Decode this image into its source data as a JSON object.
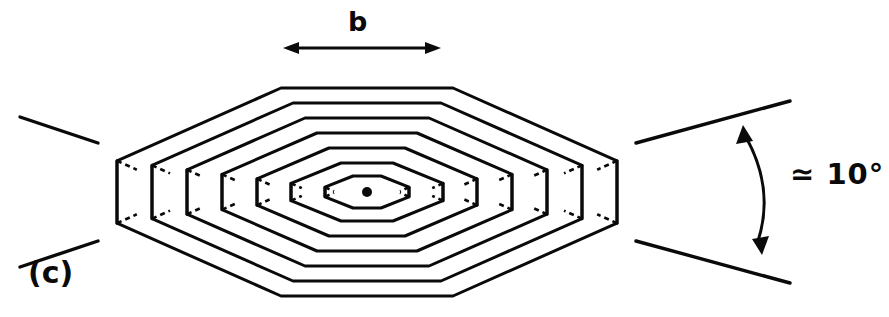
{
  "figure": {
    "panel_label": "(c)",
    "burgers_vector_label": "b",
    "angle_label": "≃ 10°",
    "stroke_color": "#0a0a0a",
    "background_color": "#ffffff",
    "center_dot": {
      "cx": 367,
      "cy": 192,
      "r": 5
    },
    "dimension_arrow": {
      "x1": 283,
      "y1": 48,
      "x2": 441,
      "y2": 48
    },
    "angle_arc": {
      "x1": 743,
      "y1": 125,
      "x2": 762,
      "y2": 255,
      "bulge": 22
    },
    "rings": [
      {
        "index": 1,
        "half_width": 42,
        "half_height": 16,
        "flat_half": 14,
        "depth": 10
      },
      {
        "index": 2,
        "half_width": 76,
        "half_height": 29,
        "flat_half": 26,
        "depth": 12
      },
      {
        "index": 3,
        "half_width": 110,
        "half_height": 44,
        "flat_half": 38,
        "depth": 14
      },
      {
        "index": 4,
        "half_width": 145,
        "half_height": 59,
        "flat_half": 50,
        "depth": 16
      },
      {
        "index": 5,
        "half_width": 180,
        "half_height": 74,
        "flat_half": 62,
        "depth": 18
      },
      {
        "index": 6,
        "half_width": 215,
        "half_height": 89,
        "flat_half": 74,
        "depth": 20
      },
      {
        "index": 7,
        "half_width": 250,
        "half_height": 104,
        "flat_half": 86,
        "depth": 22
      }
    ],
    "splay_left": {
      "top": {
        "x1": 20,
        "y1": 117,
        "x2": 98,
        "y2": 143
      },
      "bottom": {
        "x1": 20,
        "y1": 267,
        "x2": 98,
        "y2": 241
      }
    },
    "splay_right": {
      "top": {
        "x1": 636,
        "y1": 143,
        "x2": 790,
        "y2": 101
      },
      "bottom": {
        "x1": 636,
        "y1": 241,
        "x2": 790,
        "y2": 283
      }
    }
  }
}
